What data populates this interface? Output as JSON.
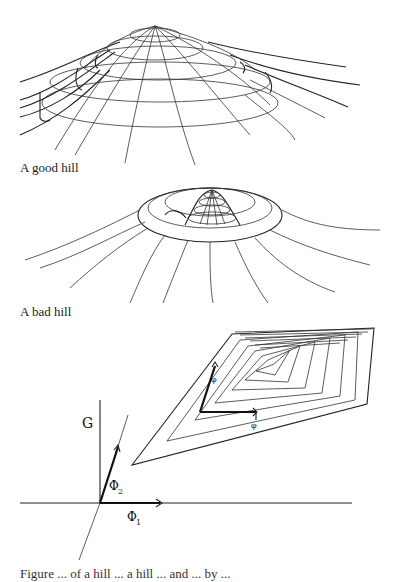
{
  "figures": [
    {
      "id": "good-hill",
      "caption": "A good hill"
    },
    {
      "id": "bad-hill",
      "caption": "A bad hill"
    },
    {
      "id": "gradient-diagram",
      "labels": {
        "vertical_axis": "G",
        "phi1": "Φ",
        "phi1_sub": "1",
        "phi2": "Φ",
        "phi2_sub": "2",
        "small_arrow_1": "φ",
        "small_arrow_2": "φ"
      }
    }
  ],
  "bottom_caption_partial": "Figure ... of a hill ... a hill ... and ... by ..."
}
